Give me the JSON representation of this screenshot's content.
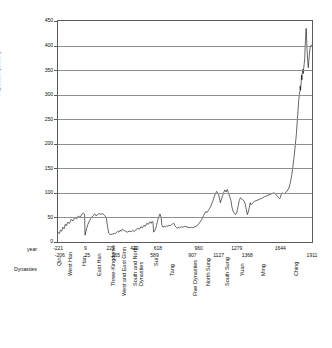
{
  "chart_data": {
    "type": "line",
    "title": "",
    "xlabel": "",
    "ylabel": "Population(Million)",
    "ylim": [
      0,
      450
    ],
    "ytick_step": 50,
    "yticks": [
      0,
      50,
      100,
      150,
      200,
      250,
      300,
      350,
      400,
      450
    ],
    "grid": true,
    "legend": false,
    "xlim": [
      -221,
      1911
    ],
    "row_headers": {
      "year": "year",
      "dynasties": "Dynasties"
    },
    "year_ticks_upper": [
      {
        "label": "-221",
        "year": -221
      },
      {
        "label": "9",
        "year": 9
      },
      {
        "label": "221",
        "year": 221
      },
      {
        "label": "420",
        "year": 420
      },
      {
        "label": "618",
        "year": 618
      },
      {
        "label": "960",
        "year": 960
      },
      {
        "label": "1279",
        "year": 1279
      },
      {
        "label": "1644",
        "year": 1644
      }
    ],
    "year_ticks_lower": [
      {
        "label": "-206",
        "year": -206
      },
      {
        "label": "25",
        "year": 25
      },
      {
        "label": "265",
        "year": 265
      },
      {
        "label": "589",
        "year": 589
      },
      {
        "label": "907",
        "year": 907
      },
      {
        "label": "1127",
        "year": 1127
      },
      {
        "label": "1368",
        "year": 1368
      },
      {
        "label": "1911",
        "year": 1911
      }
    ],
    "dynasties": [
      {
        "name": "Qin",
        "year": -213,
        "tier": 0
      },
      {
        "name": "West Han",
        "year": -120,
        "tier": 1
      },
      {
        "name": "Han",
        "year": 0,
        "tier": 0
      },
      {
        "name": "East Han",
        "year": 120,
        "tier": 1
      },
      {
        "name": "Three-Kingdoms",
        "year": 240,
        "tier": 2
      },
      {
        "name": "West and East Ginn",
        "year": 330,
        "tier": 3
      },
      {
        "name": "South and North\nDynasties",
        "year": 450,
        "tier": 2
      },
      {
        "name": "Sui",
        "year": 600,
        "tier": 0
      },
      {
        "name": "Tang",
        "year": 740,
        "tier": 1
      },
      {
        "name": "Five Dynasties",
        "year": 930,
        "tier": 3
      },
      {
        "name": "North Sung",
        "year": 1040,
        "tier": 2
      },
      {
        "name": "South Sung",
        "year": 1200,
        "tier": 2
      },
      {
        "name": "Yuan",
        "year": 1320,
        "tier": 1
      },
      {
        "name": "Ming",
        "year": 1500,
        "tier": 1
      },
      {
        "name": "Ching",
        "year": 1780,
        "tier": 1
      }
    ],
    "series": [
      {
        "name": "Population",
        "color": "#000000",
        "points": [
          [
            -221,
            20
          ],
          [
            -210,
            17
          ],
          [
            -200,
            24
          ],
          [
            -190,
            22
          ],
          [
            -180,
            30
          ],
          [
            -170,
            27
          ],
          [
            -160,
            36
          ],
          [
            -150,
            33
          ],
          [
            -140,
            40
          ],
          [
            -125,
            38
          ],
          [
            -110,
            46
          ],
          [
            -95,
            43
          ],
          [
            -80,
            50
          ],
          [
            -65,
            47
          ],
          [
            -50,
            53
          ],
          [
            -35,
            50
          ],
          [
            -20,
            57
          ],
          [
            -8,
            59
          ],
          [
            2,
            57
          ],
          [
            6,
            14
          ],
          [
            12,
            20
          ],
          [
            20,
            28
          ],
          [
            30,
            36
          ],
          [
            45,
            44
          ],
          [
            60,
            50
          ],
          [
            75,
            54
          ],
          [
            88,
            57
          ],
          [
            100,
            53
          ],
          [
            110,
            56
          ],
          [
            125,
            58
          ],
          [
            140,
            56
          ],
          [
            150,
            58
          ],
          [
            157,
            57
          ],
          [
            170,
            54
          ],
          [
            184,
            50
          ],
          [
            196,
            30
          ],
          [
            205,
            18
          ],
          [
            214,
            16
          ],
          [
            221,
            15
          ],
          [
            235,
            16
          ],
          [
            250,
            17
          ],
          [
            263,
            18
          ],
          [
            280,
            22
          ],
          [
            290,
            20
          ],
          [
            300,
            24
          ],
          [
            310,
            22
          ],
          [
            320,
            26
          ],
          [
            330,
            24
          ],
          [
            345,
            22
          ],
          [
            360,
            20
          ],
          [
            375,
            22
          ],
          [
            390,
            21
          ],
          [
            405,
            23
          ],
          [
            420,
            22
          ],
          [
            435,
            25
          ],
          [
            450,
            28
          ],
          [
            462,
            26
          ],
          [
            475,
            31
          ],
          [
            487,
            29
          ],
          [
            500,
            34
          ],
          [
            512,
            32
          ],
          [
            525,
            38
          ],
          [
            537,
            36
          ],
          [
            550,
            41
          ],
          [
            560,
            38
          ],
          [
            570,
            42
          ],
          [
            577,
            39
          ],
          [
            581,
            20
          ],
          [
            589,
            22
          ],
          [
            600,
            28
          ],
          [
            606,
            34
          ],
          [
            612,
            40
          ],
          [
            618,
            46
          ],
          [
            626,
            52
          ],
          [
            635,
            57
          ],
          [
            645,
            50
          ],
          [
            650,
            35
          ],
          [
            660,
            30
          ],
          [
            670,
            32
          ],
          [
            680,
            31
          ],
          [
            690,
            33
          ],
          [
            700,
            32
          ],
          [
            710,
            34
          ],
          [
            720,
            33
          ],
          [
            730,
            35
          ],
          [
            742,
            37
          ],
          [
            750,
            38
          ],
          [
            755,
            37
          ],
          [
            760,
            33
          ],
          [
            770,
            30
          ],
          [
            780,
            28
          ],
          [
            790,
            30
          ],
          [
            800,
            29
          ],
          [
            812,
            31
          ],
          [
            825,
            30
          ],
          [
            840,
            32
          ],
          [
            855,
            31
          ],
          [
            870,
            30
          ],
          [
            885,
            29
          ],
          [
            900,
            30
          ],
          [
            907,
            29
          ],
          [
            920,
            30
          ],
          [
            935,
            32
          ],
          [
            945,
            33
          ],
          [
            955,
            35
          ],
          [
            960,
            37
          ],
          [
            975,
            42
          ],
          [
            990,
            48
          ],
          [
            1000,
            54
          ],
          [
            1010,
            58
          ],
          [
            1020,
            62
          ],
          [
            1030,
            60
          ],
          [
            1040,
            64
          ],
          [
            1050,
            68
          ],
          [
            1060,
            72
          ],
          [
            1070,
            78
          ],
          [
            1080,
            84
          ],
          [
            1090,
            92
          ],
          [
            1100,
            98
          ],
          [
            1110,
            103
          ],
          [
            1120,
            100
          ],
          [
            1127,
            97
          ],
          [
            1135,
            88
          ],
          [
            1142,
            80
          ],
          [
            1150,
            86
          ],
          [
            1160,
            94
          ],
          [
            1170,
            101
          ],
          [
            1180,
            106
          ],
          [
            1190,
            102
          ],
          [
            1200,
            107
          ],
          [
            1210,
            100
          ],
          [
            1220,
            93
          ],
          [
            1230,
            85
          ],
          [
            1240,
            70
          ],
          [
            1250,
            62
          ],
          [
            1260,
            58
          ],
          [
            1270,
            56
          ],
          [
            1279,
            60
          ],
          [
            1290,
            72
          ],
          [
            1300,
            84
          ],
          [
            1310,
            90
          ],
          [
            1320,
            88
          ],
          [
            1330,
            86
          ],
          [
            1340,
            84
          ],
          [
            1350,
            78
          ],
          [
            1360,
            66
          ],
          [
            1368,
            56
          ],
          [
            1375,
            60
          ],
          [
            1385,
            70
          ],
          [
            1393,
            80
          ],
          [
            1400,
            76
          ],
          [
            1415,
            80
          ],
          [
            1430,
            83
          ],
          [
            1450,
            85
          ],
          [
            1470,
            87
          ],
          [
            1490,
            89
          ],
          [
            1510,
            92
          ],
          [
            1530,
            94
          ],
          [
            1550,
            96
          ],
          [
            1570,
            98
          ],
          [
            1590,
            100
          ],
          [
            1600,
            99
          ],
          [
            1610,
            97
          ],
          [
            1620,
            93
          ],
          [
            1630,
            90
          ],
          [
            1640,
            88
          ],
          [
            1644,
            90
          ],
          [
            1650,
            95
          ],
          [
            1660,
            100
          ],
          [
            1670,
            99
          ],
          [
            1680,
            98
          ],
          [
            1690,
            101
          ],
          [
            1700,
            103
          ],
          [
            1710,
            107
          ],
          [
            1720,
            112
          ],
          [
            1730,
            122
          ],
          [
            1740,
            135
          ],
          [
            1750,
            152
          ],
          [
            1760,
            172
          ],
          [
            1770,
            195
          ],
          [
            1780,
            220
          ],
          [
            1790,
            255
          ],
          [
            1800,
            290
          ],
          [
            1805,
            300
          ],
          [
            1810,
            308
          ],
          [
            1812,
            318
          ],
          [
            1815,
            309
          ],
          [
            1820,
            325
          ],
          [
            1823,
            340
          ],
          [
            1826,
            330
          ],
          [
            1830,
            345
          ],
          [
            1834,
            352
          ],
          [
            1838,
            343
          ],
          [
            1842,
            355
          ],
          [
            1846,
            364
          ],
          [
            1850,
            373
          ],
          [
            1851,
            382
          ],
          [
            1853,
            395
          ],
          [
            1856,
            410
          ],
          [
            1860,
            428
          ],
          [
            1862,
            435
          ],
          [
            1866,
            412
          ],
          [
            1870,
            390
          ],
          [
            1874,
            372
          ],
          [
            1878,
            360
          ],
          [
            1880,
            355
          ],
          [
            1884,
            368
          ],
          [
            1888,
            380
          ],
          [
            1893,
            392
          ],
          [
            1898,
            398
          ],
          [
            1905,
            401
          ],
          [
            1911,
            400
          ]
        ]
      }
    ]
  }
}
